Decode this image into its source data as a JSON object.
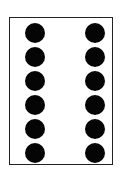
{
  "figure": {
    "shape": "rectangle-card",
    "dot_color": "#050505",
    "border_color": "#222222",
    "columns": 2,
    "rows": 6,
    "dot_count": 12,
    "dots": [
      {
        "col": 0,
        "row": 0
      },
      {
        "col": 1,
        "row": 0
      },
      {
        "col": 0,
        "row": 1
      },
      {
        "col": 1,
        "row": 1
      },
      {
        "col": 0,
        "row": 2
      },
      {
        "col": 1,
        "row": 2
      },
      {
        "col": 0,
        "row": 3
      },
      {
        "col": 1,
        "row": 3
      },
      {
        "col": 0,
        "row": 4
      },
      {
        "col": 1,
        "row": 4
      },
      {
        "col": 0,
        "row": 5
      },
      {
        "col": 1,
        "row": 5
      }
    ]
  }
}
